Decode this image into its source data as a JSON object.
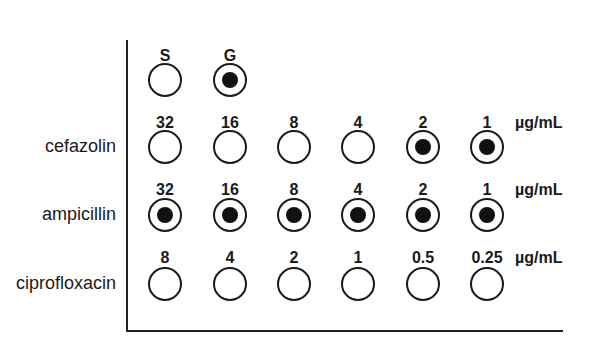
{
  "controls": {
    "labels": [
      "S",
      "G"
    ],
    "growth": [
      false,
      true
    ]
  },
  "unit": "µg/mL",
  "rows": [
    {
      "drug": "cefazolin",
      "concentrations": [
        "32",
        "16",
        "8",
        "4",
        "2",
        "1"
      ],
      "growth": [
        false,
        false,
        false,
        false,
        true,
        true
      ]
    },
    {
      "drug": "ampicillin",
      "concentrations": [
        "32",
        "16",
        "8",
        "4",
        "2",
        "1"
      ],
      "growth": [
        true,
        true,
        true,
        true,
        true,
        true
      ]
    },
    {
      "drug": "ciprofloxacin",
      "concentrations": [
        "8",
        "4",
        "2",
        "1",
        "0.5",
        "0.25"
      ],
      "growth": [
        false,
        false,
        false,
        false,
        false,
        false
      ]
    }
  ],
  "legend_note": "Filled dot = bacterial growth; empty well = no growth"
}
